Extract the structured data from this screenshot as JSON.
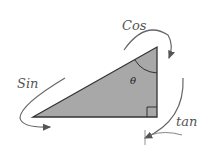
{
  "diagram": {
    "type": "right-triangle-trig-mnemonic",
    "angle_label": "θ",
    "labels": {
      "cos": "Cos",
      "sin": "Sin",
      "tan": "tan"
    },
    "colors": {
      "triangle_fill": "#a8a8a8",
      "stroke": "#333333",
      "arrow": "#555555",
      "background": "#ffffff"
    }
  }
}
